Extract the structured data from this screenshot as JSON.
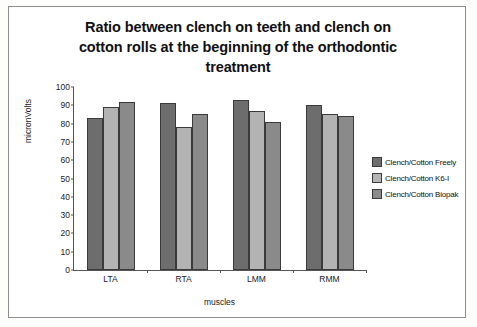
{
  "chart_data": {
    "type": "bar",
    "title": "Ratio between clench on teeth and clench on cotton rolls at the beginning of the orthodontic treatment",
    "title_lines": [
      "Ratio between clench on teeth and clench on",
      "cotton rolls at the beginning of the orthodontic",
      "treatment"
    ],
    "xlabel": "muscles",
    "ylabel": "micronVolts",
    "categories": [
      "LTA",
      "RTA",
      "LMM",
      "RMM"
    ],
    "ylim": [
      0,
      100
    ],
    "yticks": [
      0,
      10,
      20,
      30,
      40,
      50,
      60,
      70,
      80,
      90,
      100
    ],
    "grid": false,
    "legend_position": "right",
    "series": [
      {
        "name": "Clench/Cotton Freely",
        "color": "#6d6d6d",
        "values": [
          83,
          91,
          93,
          90
        ]
      },
      {
        "name": "Clench/Cotton K6-I",
        "color": "#b3b3b3",
        "values": [
          89,
          78,
          87,
          85
        ]
      },
      {
        "name": "Clench/Cotton Biopak",
        "color": "#8a8a8a",
        "values": [
          92,
          85,
          81,
          84
        ]
      }
    ]
  }
}
